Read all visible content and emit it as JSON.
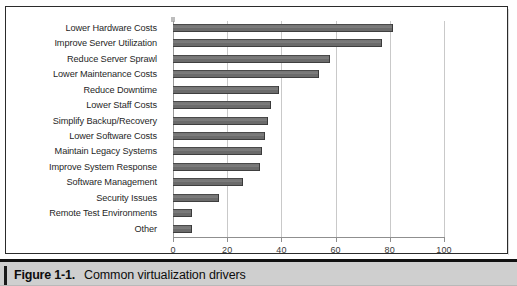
{
  "figure": {
    "number_label": "Figure 1-1.",
    "title": "Common virtualization drivers"
  },
  "chart_data": {
    "type": "bar",
    "orientation": "horizontal",
    "title": "",
    "xlabel": "",
    "ylabel": "",
    "xlim": [
      0,
      100
    ],
    "xticks": [
      "0",
      "20",
      "40",
      "60",
      "80",
      "100"
    ],
    "grid": true,
    "legend": "none",
    "bar_color": "#6e6e6e",
    "categories": [
      "Lower Hardware Costs",
      "Improve Server Utilization",
      "Reduce Server Sprawl",
      "Lower Maintenance Costs",
      "Reduce Downtime",
      "Lower Staff Costs",
      "Simplify Backup/Recovery",
      "Lower Software Costs",
      "Maintain Legacy Systems",
      "Improve System Response",
      "Software Management",
      "Security Issues",
      "Remote Test Environments",
      "Other"
    ],
    "values": [
      81,
      77,
      58,
      54,
      39,
      36,
      35,
      34,
      33,
      32,
      26,
      17,
      7,
      7
    ]
  }
}
